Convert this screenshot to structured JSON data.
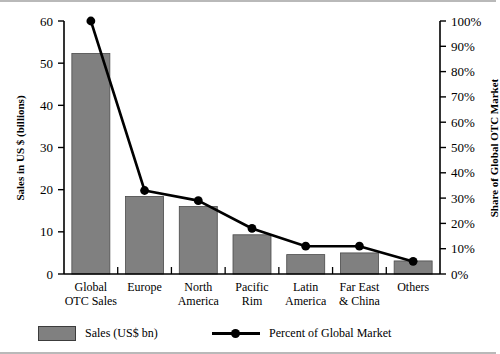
{
  "chart_data": {
    "type": "bar",
    "title": "",
    "subtitle": "",
    "categories": [
      "Global OTC Sales",
      "Europe",
      "North America",
      "Pacific Rim",
      "Latin America",
      "Far East & China",
      "Others"
    ],
    "category_lines": [
      [
        "Global",
        "OTC Sales"
      ],
      [
        "Europe",
        ""
      ],
      [
        "North",
        "America"
      ],
      [
        "Pacific",
        "Rim"
      ],
      [
        "Latin",
        "America"
      ],
      [
        "Far East",
        "& China"
      ],
      [
        "Others",
        ""
      ]
    ],
    "series": [
      {
        "name": "Sales (US$ bn)",
        "type": "bar",
        "axis": "left",
        "values": [
          52.3,
          18.4,
          16.0,
          9.3,
          4.6,
          5.0,
          3.1
        ],
        "color": "#808080"
      },
      {
        "name": "Percent of Global Market",
        "type": "line",
        "axis": "right",
        "values": [
          100,
          33,
          29,
          18,
          11,
          11,
          5
        ],
        "color": "#000000"
      }
    ],
    "xlabel": "",
    "ylabel": "Sales in US $ (billions)",
    "y2label": "Share of Global OTC Market",
    "ylim": [
      0,
      60
    ],
    "y2lim": [
      0,
      100
    ],
    "yticks": [
      0,
      10,
      20,
      30,
      40,
      50,
      60
    ],
    "ytick_labels": [
      "0",
      "10",
      "20",
      "30",
      "40",
      "50",
      "60"
    ],
    "y2ticks": [
      0,
      10,
      20,
      30,
      40,
      50,
      60,
      70,
      80,
      90,
      100
    ],
    "y2tick_labels": [
      "0%",
      "10%",
      "20%",
      "30%",
      "40%",
      "50%",
      "60%",
      "70%",
      "80%",
      "90%",
      "100%"
    ],
    "grid": false,
    "legend_position": "bottom"
  },
  "legend": {
    "bar_label": "Sales (US$ bn)",
    "line_label": "Percent of Global Market"
  },
  "axes": {
    "left_title": "Sales in US $ (billions)",
    "right_title": "Share of Global OTC Market"
  }
}
